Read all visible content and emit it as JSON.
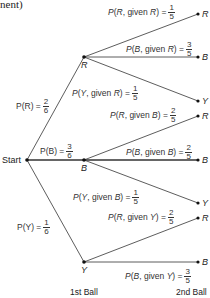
{
  "header": {
    "fragment": "nent)"
  },
  "axis_labels": {
    "first": "1st Ball",
    "second": "2nd Ball"
  },
  "start": {
    "label": "Start"
  },
  "first_level": [
    {
      "label": "R",
      "prob_text": "P(R) =",
      "var": "R",
      "num": "2",
      "den": "6"
    },
    {
      "label": "B",
      "prob_text": "P(B) =",
      "var": "B",
      "num": "3",
      "den": "6"
    },
    {
      "label": "Y",
      "prob_text": "P(Y) =",
      "var": "Y",
      "num": "1",
      "den": "6"
    }
  ],
  "second_level": {
    "R": [
      {
        "label": "R",
        "given": "R",
        "outcome": "R",
        "num": "1",
        "den": "5"
      },
      {
        "label": "B",
        "given": "R",
        "outcome": "B",
        "num": "3",
        "den": "5"
      },
      {
        "label": "Y",
        "given": "R",
        "outcome": "Y",
        "num": "1",
        "den": "5"
      }
    ],
    "B": [
      {
        "label": "R",
        "given": "B",
        "outcome": "R",
        "num": "2",
        "den": "5"
      },
      {
        "label": "B",
        "given": "B",
        "outcome": "B",
        "num": "2",
        "den": "5"
      },
      {
        "label": "Y",
        "given": "B",
        "outcome": "Y",
        "num": "1",
        "den": "5"
      }
    ],
    "Y": [
      {
        "label": "R",
        "given": "Y",
        "outcome": "R",
        "num": "2",
        "den": "5"
      },
      {
        "label": "B",
        "given": "Y",
        "outcome": "B",
        "num": "3",
        "den": "5"
      }
    ]
  },
  "text": {
    "given": "given",
    "eq": "="
  }
}
